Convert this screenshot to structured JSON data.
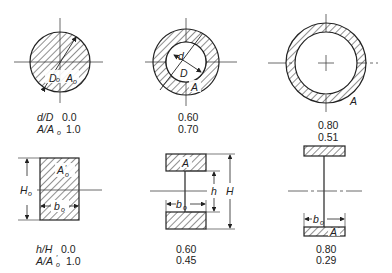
{
  "diagram": {
    "row1": {
      "param1_label": "d/D",
      "param2_label": "A/A",
      "param2_sub": "o",
      "shapes": [
        {
          "name": "solid-circle",
          "ratio": "0.0",
          "area_ratio": "1.0",
          "labels": [
            "D",
            "o",
            "A",
            "o"
          ]
        },
        {
          "name": "hollow-circle-thick",
          "ratio": "0.60",
          "area_ratio": "0.70",
          "labels": [
            "d",
            "D",
            "A"
          ]
        },
        {
          "name": "hollow-circle-thin",
          "ratio": "0.80",
          "area_ratio": "0.51",
          "labels": [
            "A"
          ]
        }
      ]
    },
    "row2": {
      "param1_label": "h/H",
      "param2_label": "A/A",
      "param2_sub": "o",
      "shapes": [
        {
          "name": "solid-rectangle",
          "ratio": "0.0",
          "area_ratio": "1.0",
          "labels": [
            "A'o",
            "Ho",
            "bo"
          ]
        },
        {
          "name": "i-section-medium",
          "ratio": "0.60",
          "area_ratio": "0.45",
          "labels": [
            "A",
            "h",
            "H",
            "bo"
          ]
        },
        {
          "name": "i-section-deep",
          "ratio": "0.80",
          "area_ratio": "0.29",
          "labels": [
            "bo",
            "A"
          ]
        }
      ]
    },
    "text": {
      "D": "D",
      "o": "o",
      "A": "A",
      "d": "d",
      "h": "h",
      "H": "H",
      "b": "b",
      "prime": "′"
    }
  }
}
